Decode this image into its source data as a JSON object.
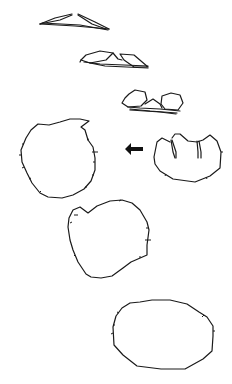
{
  "figure": {
    "type": "line-drawing sequence of cross-section outlines",
    "background": "#ffffff",
    "stroke_color": "#1a1a1a",
    "panels": [
      {
        "id": "stage-1",
        "description": "flattened triangular lens pair",
        "position": "top"
      },
      {
        "id": "stage-2",
        "description": "two small lobes on base",
        "position": "upper-middle"
      },
      {
        "id": "stage-3",
        "description": "two hexagonal lobes on base",
        "position": "middle-right"
      },
      {
        "id": "stage-4",
        "description": "three-chambered rounded form with two internal partitions",
        "position": "right"
      },
      {
        "id": "stage-5",
        "description": "large rounded polygon with notch and tick marks",
        "position": "left"
      },
      {
        "id": "stage-6",
        "description": "heart-like rounded outline with notch",
        "position": "lower-middle"
      },
      {
        "id": "stage-7",
        "description": "wide oval polygon",
        "position": "bottom"
      }
    ],
    "arrow": {
      "direction": "left",
      "from": "stage-4",
      "to": "stage-5"
    }
  }
}
